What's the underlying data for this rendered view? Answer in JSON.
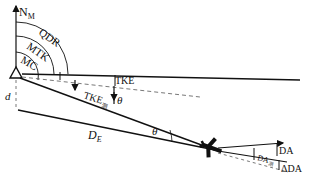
{
  "diagram": {
    "type": "navigation-geometry",
    "labels": {
      "north": "N",
      "north_sub": "M",
      "qdr": "QDR",
      "mtk": "MTK",
      "mc": "MC",
      "d": "d",
      "tke_label": "TKE",
      "tke_sub_label": "TKE",
      "tke_sub": "测",
      "theta1": "θ",
      "theta2": "θ",
      "de": "D",
      "de_sub": "E",
      "da": "DA",
      "da_sub": "DA",
      "da_sub_sub": "测",
      "delta_da": "ΔDA"
    },
    "colors": {
      "line": "#111111",
      "dash": "#555555",
      "background": "#ffffff"
    }
  }
}
